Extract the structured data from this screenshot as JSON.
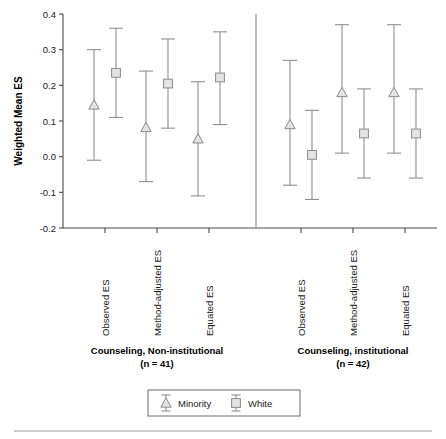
{
  "chart_data": {
    "type": "scatter",
    "title": "",
    "subtitle": "",
    "xlabel": "",
    "ylabel": "Weighted Mean ES",
    "ylim": [
      -0.2,
      0.4
    ],
    "ytick_labels": [
      "0.4",
      "0.3",
      "0.2",
      "0.1",
      "0.0",
      "-0.1",
      "-0.2"
    ],
    "ytick_values": [
      0.4,
      0.3,
      0.2,
      0.1,
      0.0,
      -0.1,
      -0.2
    ],
    "grid": false,
    "legend_position": "bottom-center",
    "error_bars": "95% confidence interval",
    "legend": [
      {
        "name": "Minority",
        "marker": "triangle"
      },
      {
        "name": "White",
        "marker": "square"
      }
    ],
    "categories": [
      "Observed ES",
      "Method-adjusted ES",
      "Equated ES"
    ],
    "groups": [
      {
        "name": "Counseling, Non-institutional",
        "n_label": "(n = 41)",
        "n": 41,
        "points": [
          {
            "category": "Observed ES",
            "series": "Minority",
            "value": 0.145,
            "lower": -0.01,
            "upper": 0.3
          },
          {
            "category": "Observed ES",
            "series": "White",
            "value": 0.235,
            "lower": 0.11,
            "upper": 0.36
          },
          {
            "category": "Method-adjusted ES",
            "series": "Minority",
            "value": 0.082,
            "lower": -0.07,
            "upper": 0.24
          },
          {
            "category": "Method-adjusted ES",
            "series": "White",
            "value": 0.205,
            "lower": 0.08,
            "upper": 0.33
          },
          {
            "category": "Equated ES",
            "series": "Minority",
            "value": 0.05,
            "lower": -0.11,
            "upper": 0.21
          },
          {
            "category": "Equated ES",
            "series": "White",
            "value": 0.222,
            "lower": 0.09,
            "upper": 0.35
          }
        ]
      },
      {
        "name": "Counseling, institutional",
        "n_label": "(n = 42)",
        "n": 42,
        "points": [
          {
            "category": "Observed ES",
            "series": "Minority",
            "value": 0.09,
            "lower": -0.08,
            "upper": 0.27
          },
          {
            "category": "Observed ES",
            "series": "White",
            "value": 0.005,
            "lower": -0.12,
            "upper": 0.13
          },
          {
            "category": "Method-adjusted ES",
            "series": "Minority",
            "value": 0.18,
            "lower": 0.01,
            "upper": 0.37
          },
          {
            "category": "Method-adjusted ES",
            "series": "White",
            "value": 0.065,
            "lower": -0.06,
            "upper": 0.19
          },
          {
            "category": "Equated ES",
            "series": "Minority",
            "value": 0.18,
            "lower": 0.01,
            "upper": 0.37
          },
          {
            "category": "Equated ES",
            "series": "White",
            "value": 0.065,
            "lower": -0.06,
            "upper": 0.19
          }
        ]
      }
    ],
    "colors": {
      "marker_fill": "#e3e3e3",
      "marker_stroke": "#8a8a8a",
      "whisker": "#8f8f8f",
      "axis": "#4a4a4a",
      "text": "#1a1a1a"
    }
  }
}
